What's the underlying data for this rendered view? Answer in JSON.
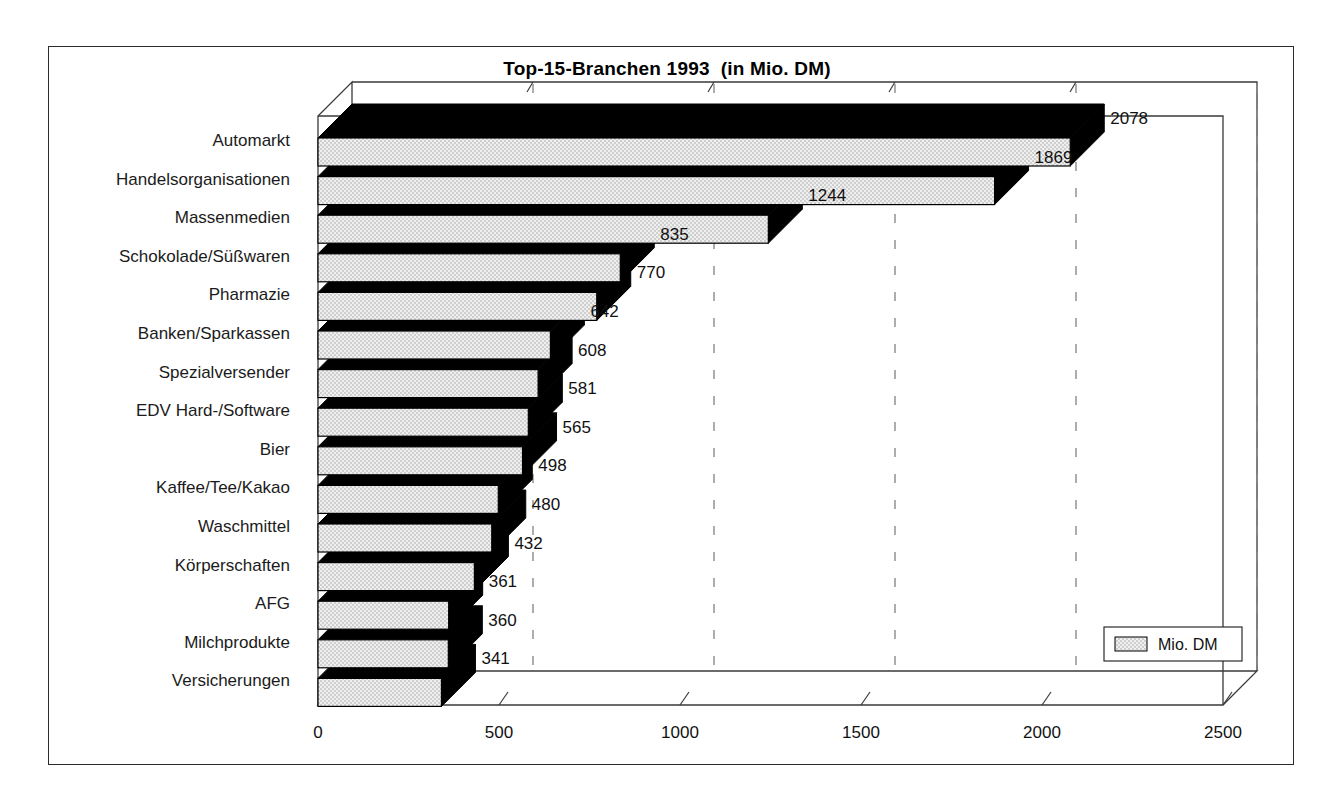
{
  "chart_data": {
    "type": "bar",
    "orientation": "horizontal",
    "title": "Top-15-Branchen 1993  (in Mio. DM)",
    "xlabel": "",
    "ylabel": "",
    "xlim": [
      0,
      2500
    ],
    "xticks": [
      0,
      500,
      1000,
      1500,
      2000,
      2500
    ],
    "xtick_labels": [
      "0",
      "500",
      "1000",
      "1500",
      "2000",
      "2500"
    ],
    "grid": "vertical-dashed",
    "legend": {
      "position": "bottom-right-inside",
      "entries": [
        {
          "label": "Mio. DM",
          "swatch_color": "#dcdcdc"
        }
      ]
    },
    "categories": [
      "Automarkt",
      "Handelsorganisationen",
      "Massenmedien",
      "Schokolade/Süßwaren",
      "Pharmazie",
      "Banken/Sparkassen",
      "Spezialversender",
      "EDV Hard-/Software",
      "Bier",
      "Kaffee/Tee/Kakao",
      "Waschmittel",
      "Körperschaften",
      "AFG",
      "Milchprodukte",
      "Versicherungen"
    ],
    "values": [
      2078,
      1869,
      1244,
      835,
      770,
      642,
      608,
      581,
      565,
      498,
      480,
      432,
      361,
      360,
      341
    ],
    "value_labels": [
      "2078",
      "1869",
      "1244",
      "835",
      "770",
      "642",
      "608",
      "581",
      "565",
      "498",
      "480",
      "432",
      "361",
      "360",
      "341"
    ],
    "series": [
      {
        "name": "Mio. DM",
        "values": [
          2078,
          1869,
          1244,
          835,
          770,
          642,
          608,
          581,
          565,
          498,
          480,
          432,
          361,
          360,
          341
        ]
      }
    ],
    "style": {
      "bar_face_color": "#dcdcdc",
      "bar_top_color": "#000000",
      "bar_side_color": "#000000",
      "bar_outline_color": "#000000",
      "axis_color": "#3a3a3a",
      "grid_color": "#8a8a8a",
      "frame_color": "#2b2b2b",
      "background": "#ffffff",
      "three_d": true
    }
  }
}
